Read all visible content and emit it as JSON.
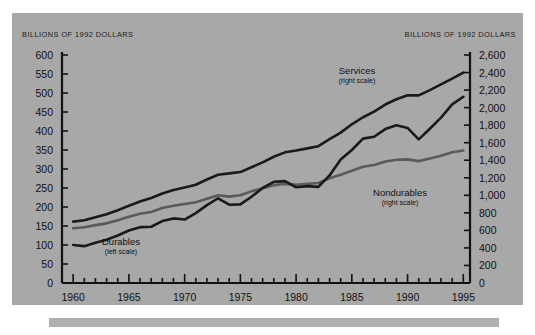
{
  "panel": {
    "background_color": "#a8a8a8",
    "left_axis_caption": "BILLIONS OF 1992 DOLLARS",
    "right_axis_caption": "BILLIONS OF 1992 DOLLARS"
  },
  "chart_data": {
    "type": "line",
    "title": "",
    "subtitle": "",
    "xlabel": "",
    "ylabel": "BILLIONS OF 1992 DOLLARS",
    "y2label": "BILLIONS OF 1992 DOLLARS",
    "xlim": [
      1959,
      1995.6
    ],
    "ylim": [
      0,
      600
    ],
    "y2lim": [
      0,
      2600
    ],
    "grid": false,
    "legend": "inline-annotations",
    "line_color": "#1a1a1a",
    "nondurables_color": "#5a5a5a",
    "x_ticks_major": [
      1960,
      1965,
      1970,
      1975,
      1980,
      1985,
      1990,
      1995
    ],
    "x_tick_labels": [
      "1960",
      "1965",
      "1970",
      "1975",
      "1980",
      "1985",
      "1990",
      "1995"
    ],
    "x_ticks_minor_step": 1,
    "y_ticks": [
      0,
      50,
      100,
      150,
      200,
      250,
      300,
      350,
      400,
      450,
      500,
      550,
      600
    ],
    "y_tick_labels": [
      "0",
      "50",
      "100",
      "150",
      "200",
      "250",
      "300",
      "350",
      "400",
      "450",
      "500",
      "550",
      "600"
    ],
    "y2_ticks": [
      0,
      200,
      400,
      600,
      800,
      1000,
      1200,
      1400,
      1600,
      1800,
      2000,
      2200,
      2400,
      2600
    ],
    "y2_tick_labels": [
      "0",
      "200",
      "400",
      "600",
      "800",
      "1,000",
      "1,200",
      "1,400",
      "1,600",
      "1,800",
      "2,000",
      "2,200",
      "2,400",
      "2,600"
    ],
    "x": [
      1960,
      1961,
      1962,
      1963,
      1964,
      1965,
      1966,
      1967,
      1968,
      1969,
      1970,
      1971,
      1972,
      1973,
      1974,
      1975,
      1976,
      1977,
      1978,
      1979,
      1980,
      1981,
      1982,
      1983,
      1984,
      1985,
      1986,
      1987,
      1988,
      1989,
      1990,
      1991,
      1992,
      1993,
      1994,
      1995
    ],
    "series": [
      {
        "name": "Services",
        "scale": "right",
        "axis": "y2",
        "label": "Services",
        "sublabel": "(right scale)",
        "color": "#1a1a1a",
        "values": [
          700,
          715,
          750,
          785,
          830,
          880,
          930,
          970,
          1020,
          1060,
          1090,
          1120,
          1180,
          1235,
          1250,
          1265,
          1320,
          1375,
          1440,
          1490,
          1510,
          1535,
          1560,
          1640,
          1715,
          1810,
          1890,
          1955,
          2035,
          2095,
          2140,
          2140,
          2200,
          2265,
          2330,
          2400
        ]
      },
      {
        "name": "Nondurables",
        "scale": "right",
        "axis": "y2",
        "label": "Nondurables",
        "sublabel": "(right scale)",
        "color": "#5a5a5a",
        "values": [
          625,
          635,
          660,
          680,
          715,
          755,
          790,
          810,
          855,
          880,
          900,
          920,
          960,
          1000,
          985,
          1000,
          1045,
          1080,
          1115,
          1130,
          1120,
          1130,
          1140,
          1195,
          1235,
          1280,
          1325,
          1345,
          1385,
          1405,
          1410,
          1390,
          1420,
          1450,
          1490,
          1510
        ]
      },
      {
        "name": "Durables",
        "scale": "left",
        "axis": "y1",
        "label": "Durables",
        "sublabel": "(left scale)",
        "color": "#1a1a1a",
        "values": [
          100,
          97,
          106,
          114,
          125,
          138,
          147,
          148,
          163,
          170,
          167,
          184,
          205,
          223,
          206,
          207,
          227,
          250,
          266,
          268,
          252,
          255,
          253,
          283,
          325,
          350,
          380,
          385,
          405,
          415,
          408,
          378,
          406,
          435,
          470,
          490
        ]
      }
    ]
  }
}
